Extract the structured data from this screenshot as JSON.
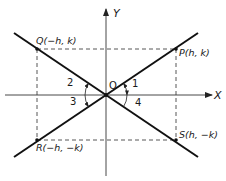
{
  "diagram": {
    "axes": {
      "x_label": "X",
      "y_label": "Y",
      "origin_label": "O"
    },
    "points": {
      "P": "P(h, k)",
      "Q": "Q(−h, k)",
      "R": "R(−h, −k)",
      "S": "S(h, −k)"
    },
    "angles": {
      "a1": "1",
      "a2": "2",
      "a3": "3",
      "a4": "4"
    },
    "colors": {
      "line": "#111111",
      "dashed": "#444444",
      "axis": "#333333",
      "background": "#ffffff"
    }
  }
}
